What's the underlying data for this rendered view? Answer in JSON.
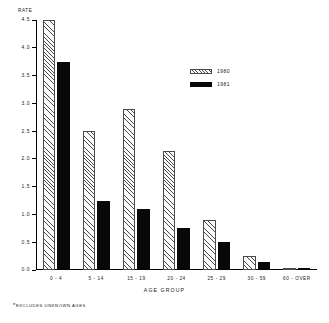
{
  "chart_data": {
    "type": "bar",
    "title": "",
    "subtitle": "",
    "xlabel": "AGE GROUP",
    "ylabel": "RATE",
    "categories": [
      "0 - 4",
      "5 - 14",
      "15 - 19",
      "20 - 24",
      "25 - 29",
      "30 - 59",
      "60 - OVER"
    ],
    "series": [
      {
        "name": "1980",
        "values": [
          4.5,
          2.5,
          2.9,
          2.15,
          0.9,
          0.25,
          0.03
        ]
      },
      {
        "name": "1981",
        "values": [
          3.75,
          1.25,
          1.1,
          0.75,
          0.5,
          0.15,
          0.02
        ]
      }
    ],
    "ylim": [
      0.0,
      4.5
    ],
    "yticks": [
      "0.0",
      "0.5",
      "1.0",
      "1.5",
      "2.0",
      "2.5",
      "3.0",
      "3.5",
      "4.0",
      "4.5"
    ],
    "ytick_values": [
      0.0,
      0.5,
      1.0,
      1.5,
      2.0,
      2.5,
      3.0,
      3.5,
      4.0,
      4.5
    ],
    "grid": false,
    "legend_position": "upper-right",
    "annotations": [
      "*EXCLUDES UNKNOWN AGES"
    ]
  },
  "axes": {
    "y_axis_title": "RATE",
    "x_axis_title": "AGE GROUP"
  },
  "legend": {
    "entries": [
      {
        "label": "1980",
        "pattern": "hatched",
        "color": "#4a4a4a"
      },
      {
        "label": "1981",
        "pattern": "solid",
        "color": "#080808"
      }
    ]
  },
  "footnote": {
    "star": "*",
    "text": "EXCLUDES UNKNOWN AGES"
  },
  "colors": {
    "series_1980": "#4a4a4a",
    "series_1981": "#080808",
    "axis": "#000000",
    "background": "#ffffff"
  }
}
